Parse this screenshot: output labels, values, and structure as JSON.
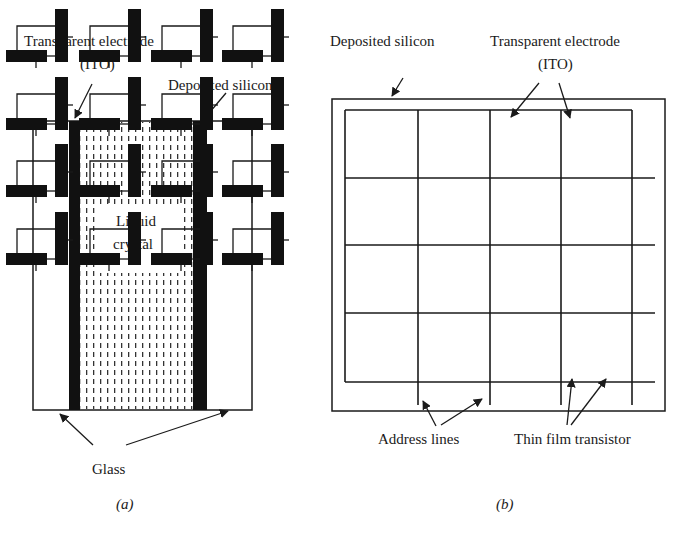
{
  "panel_a": {
    "labels": {
      "electrode_line1": "Transparent electrode",
      "electrode_line2": "(ITO)",
      "silicon": "Deposited silicon",
      "liquid_line1": "Liquid",
      "liquid_line2": "crystal",
      "glass": "Glass"
    },
    "caption_open": "(",
    "caption_letter": "a",
    "caption_close": ")"
  },
  "panel_b": {
    "labels": {
      "silicon": "Deposited silicon",
      "electrode_line1": "Transparent electrode",
      "electrode_line2": "(ITO)",
      "address_lines": "Address lines",
      "tft": "Thin film transistor"
    },
    "caption_open": "(",
    "caption_letter": "b",
    "caption_close": ")",
    "grid": {
      "rows": 4,
      "cols": 4
    }
  },
  "colors": {
    "ink": "#1a1a1a",
    "fill": "#111111",
    "background": "#ffffff"
  }
}
